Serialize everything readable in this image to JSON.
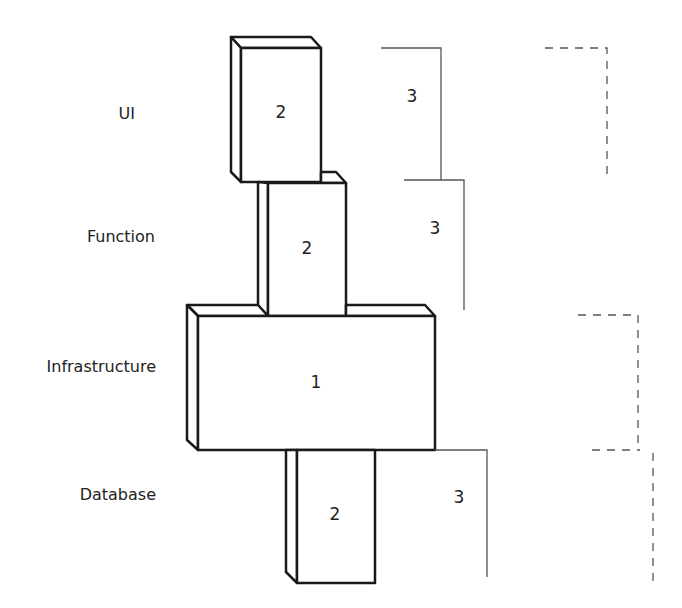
{
  "diagram": {
    "layers": [
      {
        "label": "UI",
        "box_value": "2"
      },
      {
        "label": "Function",
        "box_value": "2"
      },
      {
        "label": "Infrastructure",
        "box_value": "1"
      },
      {
        "label": "Database",
        "box_value": "2"
      }
    ],
    "solid_brackets": [
      {
        "value": "3"
      },
      {
        "value": "3"
      },
      {
        "value": "3"
      }
    ],
    "dashed_brackets": [
      {
        "value": ""
      },
      {
        "value": ""
      },
      {
        "value": ""
      }
    ],
    "colors": {
      "stroke": "#1a1a1a",
      "bracket": "#555555",
      "background": "#ffffff"
    }
  }
}
